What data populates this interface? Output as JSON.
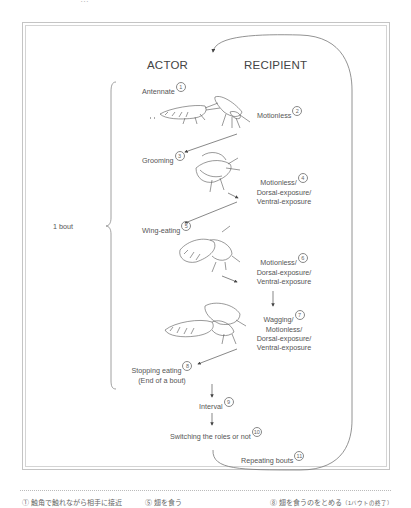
{
  "top_cut_text": "…",
  "diagram": {
    "headers": {
      "actor": "ACTOR",
      "recipient": "RECIPIENT"
    },
    "bout_label": "1 bout",
    "steps": [
      {
        "num": "1",
        "text": "Antennate",
        "side": "actor"
      },
      {
        "num": "2",
        "text": "Motionless",
        "side": "recipient"
      },
      {
        "num": "3",
        "text": "Grooming",
        "side": "actor"
      },
      {
        "num": "4",
        "lines": [
          "Motionless/",
          "Dorsal-exposure/",
          "Ventral-exposure"
        ],
        "side": "recipient"
      },
      {
        "num": "5",
        "text": "Wing-eating",
        "side": "actor"
      },
      {
        "num": "6",
        "lines": [
          "Motionless/",
          "Dorsal-exposure/",
          "Ventral-exposure"
        ],
        "side": "recipient"
      },
      {
        "num": "7",
        "lines": [
          "Wagging/",
          "Motionless/",
          "Dorsal-exposure/",
          "Ventral-exposure"
        ],
        "side": "recipient"
      },
      {
        "num": "8",
        "lines": [
          "Stopping eating",
          "(End of a bout)"
        ],
        "side": "actor"
      },
      {
        "num": "9",
        "text": "Interval",
        "side": "center"
      },
      {
        "num": "10",
        "text": "Switching the roles or not",
        "side": "center"
      },
      {
        "num": "11",
        "text": "Repeating bouts",
        "side": "center"
      }
    ]
  },
  "footer": {
    "items": [
      {
        "num": "①",
        "text": "触角で触れながら相手に接近"
      },
      {
        "num": "⑤",
        "text": "翅を食う"
      },
      {
        "num": "⑧",
        "text": "翅を食うのをとめる",
        "note": "（1バウトの終了）"
      }
    ]
  }
}
